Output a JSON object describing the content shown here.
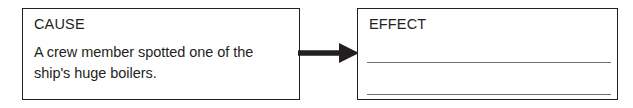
{
  "diagram": {
    "type": "cause-and-effect-worksheet",
    "ink_color": "#231f20",
    "rule_color": "#6f6f6f",
    "background_color": "#ffffff",
    "cause_box": {
      "label": "CAUSE",
      "text_lines": [
        "A crew member spotted one of the",
        "ship's huge boilers."
      ]
    },
    "connector": {
      "icon": "right-arrow-icon",
      "direction": "left-to-right"
    },
    "effect_box": {
      "label": "EFFECT",
      "text_lines": [],
      "blank_lines": [
        "",
        ""
      ]
    }
  }
}
